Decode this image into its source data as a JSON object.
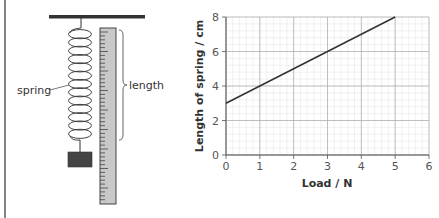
{
  "diagram": {
    "labels": {
      "spring": "spring",
      "length": "length"
    },
    "colors": {
      "line": "#333333",
      "ruler_fill": "#c8c8c8",
      "weight_fill": "#444444"
    }
  },
  "chart_data": {
    "type": "line",
    "title": "",
    "xlabel": "Load / N",
    "ylabel": "Length of spring / cm",
    "xlim": [
      0,
      6
    ],
    "ylim": [
      0,
      8
    ],
    "x_ticks": [
      "0",
      "1",
      "2",
      "3",
      "4",
      "5",
      "6"
    ],
    "y_ticks": [
      "0",
      "2",
      "4",
      "6",
      "8"
    ],
    "grid": true,
    "legend": null,
    "series": [
      {
        "name": "spring length",
        "x": [
          0,
          1,
          2,
          3,
          4,
          5
        ],
        "y": [
          3,
          4,
          5,
          6,
          7,
          8
        ]
      }
    ]
  }
}
